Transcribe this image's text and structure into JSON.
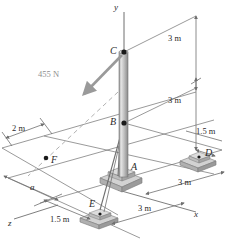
{
  "figure": {
    "background": "#ffffff",
    "line_color": "#6f6f6f",
    "pole_color": "#b9b9b9",
    "base_color": "#c9c9c9",
    "force_color": "#9a9a9a",
    "text_color": "#2b2b2b"
  },
  "points": [
    {
      "id": "A",
      "label": "A",
      "x": 117,
      "y": 168,
      "role": "pole-base-support",
      "dot": false
    },
    {
      "id": "B",
      "label": "B",
      "x": 124,
      "y": 123,
      "role": "cable-attachment",
      "dot": true
    },
    {
      "id": "C",
      "label": "C",
      "x": 124,
      "y": 52,
      "role": "pole-top-force-point",
      "dot": true
    },
    {
      "id": "D",
      "label": "D",
      "x": 200,
      "y": 155,
      "role": "anchor-base",
      "dot": true
    },
    {
      "id": "E",
      "label": "E",
      "x": 100,
      "y": 208,
      "role": "anchor-base",
      "dot": true
    },
    {
      "id": "F",
      "label": "F",
      "x": 46,
      "y": 158,
      "role": "line-of-action-point",
      "dot": true
    }
  ],
  "axes": [
    {
      "id": "y",
      "label": "y",
      "x": 118,
      "y": 5
    },
    {
      "id": "x",
      "label": "x",
      "x": 196,
      "y": 215
    },
    {
      "id": "z",
      "label": "z",
      "x": 10,
      "y": 222
    }
  ],
  "force": {
    "label": "455 N",
    "value": 455,
    "unit": "N",
    "label_x": 40,
    "label_y": 74,
    "applied_at": "C",
    "line_of_action_through": "F"
  },
  "dimensions": [
    {
      "id": "dim-top-3m",
      "label": "3 m",
      "value": 3,
      "unit": "m",
      "x": 176,
      "y": 38,
      "orientation": "vertical"
    },
    {
      "id": "dim-mid-3m",
      "label": "3 m",
      "value": 3,
      "unit": "m",
      "x": 176,
      "y": 98,
      "orientation": "vertical"
    },
    {
      "id": "dim-right-15m",
      "label": "1.5 m",
      "value": 1.5,
      "unit": "m",
      "x": 194,
      "y": 133,
      "orientation": "diagonal"
    },
    {
      "id": "dim-right-3m",
      "label": "3 m",
      "value": 3,
      "unit": "m",
      "x": 176,
      "y": 180,
      "orientation": "diagonal"
    },
    {
      "id": "dim-bottom-3m",
      "label": "3 m",
      "value": 3,
      "unit": "m",
      "x": 140,
      "y": 208,
      "orientation": "diagonal"
    },
    {
      "id": "dim-bottom-15m",
      "label": "1.5 m",
      "value": 1.5,
      "unit": "m",
      "x": 52,
      "y": 222,
      "orientation": "diagonal"
    },
    {
      "id": "dim-left-2m",
      "label": "2 m",
      "value": 2,
      "unit": "m",
      "x": 14,
      "y": 128,
      "orientation": "diagonal"
    },
    {
      "id": "dim-left-a",
      "label": "a",
      "value": null,
      "unit": "",
      "x": 31,
      "y": 188,
      "orientation": "diagonal"
    }
  ]
}
